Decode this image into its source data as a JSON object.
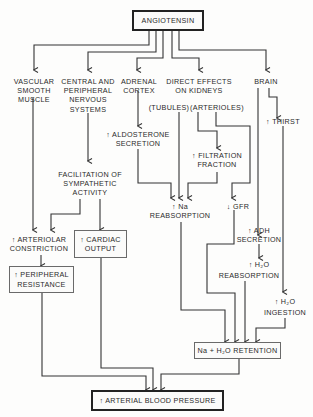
{
  "diagram": {
    "root": "ANGIOTENSIN",
    "targets": {
      "vascular": "VASCULAR\nSMOOTH\nMUSCLE",
      "nervous": "CENTRAL AND\nPERIPHERAL\nNERVOUS\nSYSTEMS",
      "adrenal": "ADRENAL\nCORTEX",
      "kidneys": "DIRECT EFFECTS\nON KIDNEYS",
      "brain": "BRAIN"
    },
    "kidney_sites": {
      "tubules": "(TUBULES)",
      "arterioles": "(ARTERIOLES)"
    },
    "effects": {
      "thirst": "↑ THIRST",
      "aldosterone": "↑ ALDOSTERONE\nSECRETION",
      "filtration": "↑ FILTRATION\nFRACTION",
      "sympathetic": "FACILITATION OF\nSYMPATHETIC\nACTIVITY",
      "na_reabsorption": "↑ Na\nREABSORPTION",
      "gfr": "↓ GFR",
      "adh": "↑ ADH\nSECRETION",
      "arteriolar": "↑ ARTERIOLAR\nCONSTRICTION",
      "cardiac": "↑ CARDIAC\nOUTPUT",
      "h2o_reabsorption_1": "↑ H₂O",
      "h2o_reabsorption_2": "REABSORPTION",
      "peripheral": "↑ PERIPHERAL\nRESISTANCE",
      "h2o_ingestion_1": "↑ H₂O",
      "h2o_ingestion_2": "INGESTION",
      "retention": "Na + H₂O RETENTION"
    },
    "outcome": "↑ ARTERIAL BLOOD PRESSURE"
  }
}
